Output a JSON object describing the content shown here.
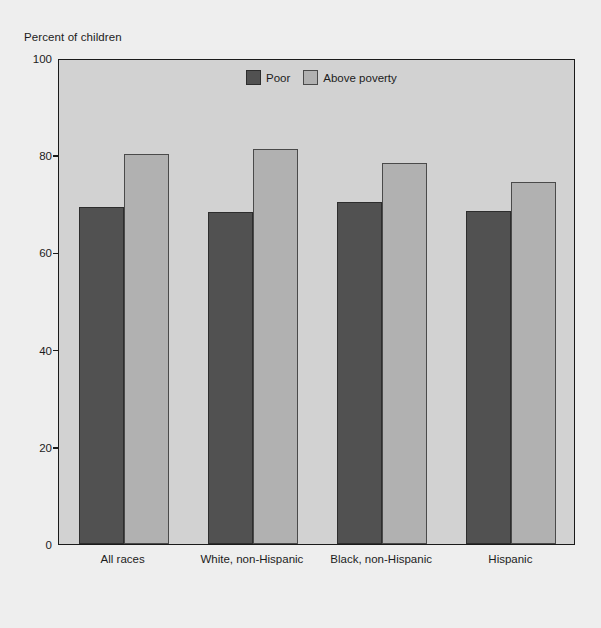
{
  "chart_data": {
    "type": "bar",
    "title": "",
    "subtitle": "",
    "ylabel": "Percent of children",
    "xlabel": "",
    "ylim": [
      0,
      100
    ],
    "yticks": [
      0,
      20,
      40,
      60,
      80,
      100
    ],
    "ytick_labels": [
      "0",
      "20",
      "40",
      "60",
      "80",
      "100"
    ],
    "grid": false,
    "legend_position": "top-center",
    "categories": [
      "All races",
      "White, non-Hispanic",
      "Black, non-Hispanic",
      "Hispanic"
    ],
    "series": [
      {
        "name": "Poor",
        "color": "#515151",
        "values": [
          69.3,
          68.3,
          70.4,
          68.5
        ]
      },
      {
        "name": "Above poverty",
        "color": "#b1b1b1",
        "values": [
          80.2,
          81.3,
          78.4,
          74.5
        ]
      }
    ]
  },
  "figure": {
    "background_color": "#eeeeee",
    "plot_background_color": "#d2d2d2",
    "axis_color": "#1a1a1a"
  }
}
